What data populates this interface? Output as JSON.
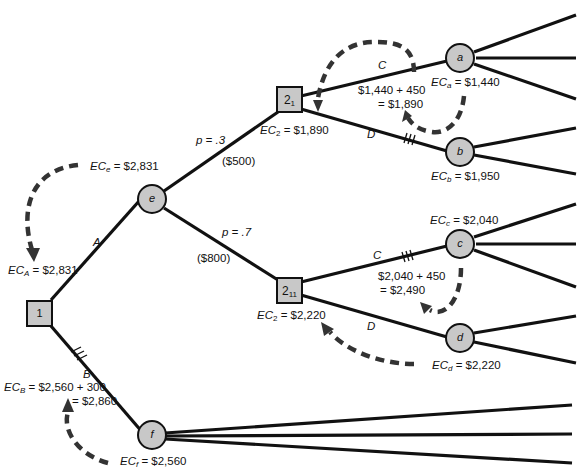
{
  "diagram": {
    "type": "decision-tree",
    "nodes": {
      "n1": {
        "label": "1",
        "kind": "decision"
      },
      "e": {
        "label": "e",
        "kind": "chance",
        "ec_prefix": "EC",
        "ec_sub": "e",
        "ec_value": "= $2,831"
      },
      "f": {
        "label": "f",
        "kind": "chance",
        "ec_prefix": "EC",
        "ec_sub": "f",
        "ec_value": "= $2,560"
      },
      "n21": {
        "label_main": "2",
        "label_sub": "1",
        "kind": "decision",
        "ec_prefix": "EC",
        "ec_sub": "2",
        "ec_value": "= $1,890"
      },
      "n211": {
        "label_main": "2",
        "label_sub": "11",
        "kind": "decision",
        "ec_prefix": "EC",
        "ec_sub": "2",
        "ec_value": "= $2,220"
      },
      "a": {
        "label": "a",
        "kind": "chance",
        "ec_prefix": "EC",
        "ec_sub": "a",
        "ec_value": "= $1,440"
      },
      "b": {
        "label": "b",
        "kind": "chance",
        "ec_prefix": "EC",
        "ec_sub": "b",
        "ec_value": "= $1,950"
      },
      "c": {
        "label": "c",
        "kind": "chance",
        "ec_prefix": "EC",
        "ec_sub": "c",
        "ec_value": "= $2,040"
      },
      "d": {
        "label": "d",
        "kind": "chance",
        "ec_prefix": "EC",
        "ec_sub": "d",
        "ec_value": "= $2,220"
      }
    },
    "edges": {
      "A": "A",
      "B": "B",
      "C_top": "C",
      "D_top": "D",
      "C_bottom": "C",
      "D_bottom": "D",
      "p_top": "p = .3",
      "cost_top": "($500)",
      "p_bottom": "p = .7",
      "cost_bottom": "($800)"
    },
    "annotations": {
      "ec_A_prefix": "EC",
      "ec_A_sub": "A",
      "ec_A_value": "= $2,831",
      "ec_B_prefix": "EC",
      "ec_B_sub": "B",
      "ec_B_line1": "= $2,560 + 300",
      "ec_B_line2": "= $2,860",
      "calc_top_line1": "$1,440 + 450",
      "calc_top_line2": "= $1,890",
      "calc_bottom_line1": "$2,040 + 450",
      "calc_bottom_line2": "= $2,490"
    },
    "colors": {
      "node_fill": "#c8c8c8",
      "line": "#111111",
      "dashed_arrow": "#333333"
    }
  }
}
